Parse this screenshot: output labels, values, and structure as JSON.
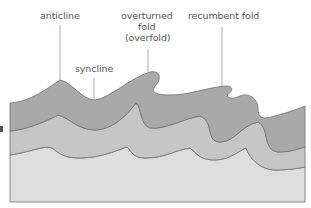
{
  "diagram": {
    "labels": {
      "anticline": "anticline",
      "syncline": "syncline",
      "overturned_line1": "overturned",
      "overturned_line2": "fold",
      "overturned_line3": "(overfold)",
      "recumbent": "recumbent fold"
    },
    "layers": [
      {
        "name": "top layer",
        "color": "#a9a9a9"
      },
      {
        "name": "middle layer",
        "color": "#c6c6c6"
      },
      {
        "name": "bottom layer",
        "color": "#dedede"
      }
    ],
    "line_color": "#6e6e6e"
  }
}
